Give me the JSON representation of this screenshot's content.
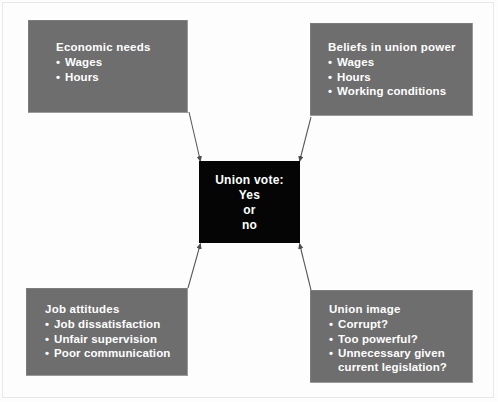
{
  "diagram": {
    "center": {
      "title": "Union vote:",
      "lines": [
        "Yes",
        "or",
        "no"
      ],
      "background_color": "#050505",
      "text_color": "#ffffff"
    },
    "boxes": [
      {
        "id": "economic-needs",
        "title": "Economic needs",
        "items": [
          "Wages",
          "Hours"
        ],
        "position": "top-left",
        "background_color": "#6e6e6e",
        "text_color": "#ffffff"
      },
      {
        "id": "union-power",
        "title": "Beliefs in union power",
        "items": [
          "Wages",
          "Hours",
          "Working conditions"
        ],
        "position": "top-right",
        "background_color": "#6e6e6e",
        "text_color": "#ffffff"
      },
      {
        "id": "job-attitudes",
        "title": "Job attitudes",
        "items": [
          "Job dissatisfaction",
          "Unfair supervision",
          "Poor communication"
        ],
        "position": "bottom-left",
        "background_color": "#6e6e6e",
        "text_color": "#ffffff"
      },
      {
        "id": "union-image",
        "title": "Union image",
        "items": [
          "Corrupt?",
          "Too powerful?",
          "Unnecessary given"
        ],
        "items_continuation": [
          "",
          "",
          "current legislation?"
        ],
        "position": "bottom-right",
        "background_color": "#6e6e6e",
        "text_color": "#ffffff"
      }
    ],
    "arrows": [
      {
        "from": "economic-needs",
        "to": "center"
      },
      {
        "from": "union-power",
        "to": "center"
      },
      {
        "from": "job-attitudes",
        "to": "center"
      },
      {
        "from": "union-image",
        "to": "center"
      }
    ],
    "arrow_color": "#555555"
  }
}
